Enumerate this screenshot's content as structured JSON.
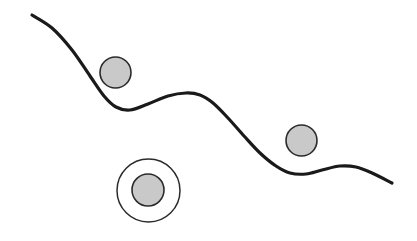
{
  "figure": {
    "title": "",
    "caption": "",
    "background_color": "#ffffff",
    "width": 417,
    "height": 241,
    "watermark": ""
  },
  "style": {
    "curve_color": "#1a1a1a",
    "curve_width": 3.2,
    "circle_fill": "#c9c9c9",
    "circle_stroke": "#2b2b2b",
    "circle_stroke_width": 1.6,
    "ring_stroke": "#2b2b2b",
    "ring_stroke_width": 1.5,
    "ring_fill": "none"
  },
  "chart_data": {
    "type": "line",
    "title": "",
    "xlabel": "",
    "ylabel": "",
    "xlim": [
      0,
      417
    ],
    "ylim": [
      241,
      0
    ],
    "grid": false,
    "legend": false,
    "series": [
      {
        "name": "wavy-curve",
        "kind": "smooth-path",
        "x": [
          32,
          52,
          72,
          90,
          104,
          116,
          130,
          148,
          168,
          186,
          200,
          213,
          228,
          244,
          260,
          276,
          290,
          306,
          322,
          340,
          356,
          372,
          392
        ],
        "y": [
          15,
          28,
          50,
          76,
          96,
          107,
          110,
          104,
          96,
          93,
          95,
          103,
          118,
          136,
          153,
          166,
          173,
          174,
          170,
          166,
          167,
          173,
          183
        ]
      }
    ],
    "markers": [
      {
        "name": "filled-circle-upper-left",
        "cx": 115.5,
        "cy": 72.5,
        "r": 15.5,
        "fill": "#c9c9c9",
        "stroke": "#2b2b2b"
      },
      {
        "name": "filled-circle-right",
        "cx": 301.5,
        "cy": 140.5,
        "r": 15.5,
        "fill": "#c9c9c9",
        "stroke": "#2b2b2b"
      },
      {
        "name": "concentric-outer-ring",
        "cx": 148.5,
        "cy": 190.5,
        "r": 31.5,
        "fill": "none",
        "stroke": "#2b2b2b"
      },
      {
        "name": "concentric-inner-circle",
        "cx": 148.0,
        "cy": 190.0,
        "r": 16.0,
        "fill": "#c9c9c9",
        "stroke": "#2b2b2b"
      }
    ]
  }
}
